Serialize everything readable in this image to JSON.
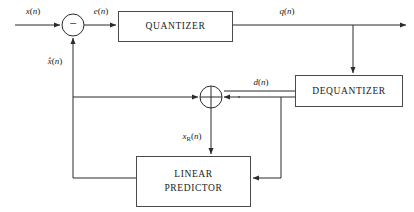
{
  "diagram": {
    "colors": {
      "line": "#2b2b2b",
      "box_border": "#4a4a4a",
      "background": "#ffffff",
      "text": "#1a1a1a"
    },
    "blocks": [
      {
        "id": "quantizer",
        "label": "QUANTIZER",
        "x": 118,
        "y": 11,
        "w": 114,
        "h": 30
      },
      {
        "id": "dequantizer",
        "label": "DEQUANTIZER",
        "x": 295,
        "y": 75,
        "w": 107,
        "h": 31
      },
      {
        "id": "predictor",
        "label_line1": "LINEAR",
        "label_line2": "PREDICTOR",
        "x": 136,
        "y": 156,
        "w": 114,
        "h": 50
      }
    ],
    "nodes": [
      {
        "id": "subtractor",
        "cx": 73,
        "cy": 25,
        "r": 11,
        "operator": "−"
      },
      {
        "id": "adder",
        "cx": 211,
        "cy": 97,
        "r": 11,
        "operator": "cross"
      }
    ],
    "signals": [
      {
        "id": "x",
        "base": "x",
        "sub": "",
        "suffix": "(n)",
        "x": 33,
        "y": 12
      },
      {
        "id": "e",
        "base": "e",
        "sub": "",
        "suffix": "(n)",
        "x": 101,
        "y": 12
      },
      {
        "id": "q",
        "base": "q",
        "sub": "",
        "suffix": "(n)",
        "x": 287,
        "y": 12
      },
      {
        "id": "xhat",
        "base": "x̂",
        "sub": "",
        "suffix": "(n)",
        "x": 55,
        "y": 62
      },
      {
        "id": "d",
        "base": "d",
        "sub": "",
        "suffix": "(n)",
        "x": 261,
        "y": 83
      },
      {
        "id": "xr",
        "base": "x",
        "sub": "R",
        "suffix": "(n)",
        "x": 192,
        "y": 137
      }
    ]
  }
}
